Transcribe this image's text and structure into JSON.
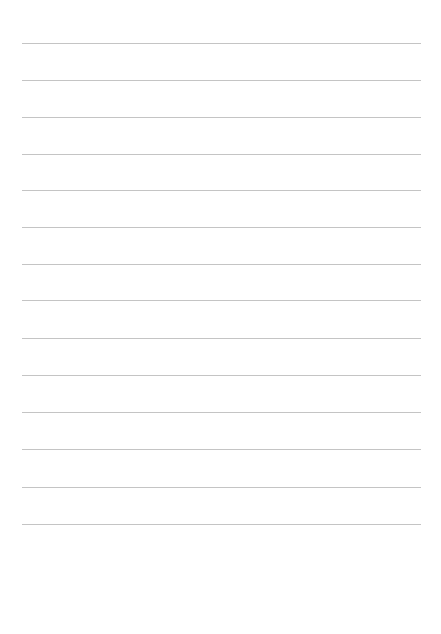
{
  "page": {
    "type": "lined-paper",
    "background": "#ffffff",
    "rule_color": "#c4c4c4",
    "rule_left": 22,
    "rule_width": 399,
    "rules_y": [
      43,
      80,
      117,
      154,
      190,
      227,
      264,
      300,
      338,
      375,
      412,
      449,
      487,
      524
    ]
  }
}
